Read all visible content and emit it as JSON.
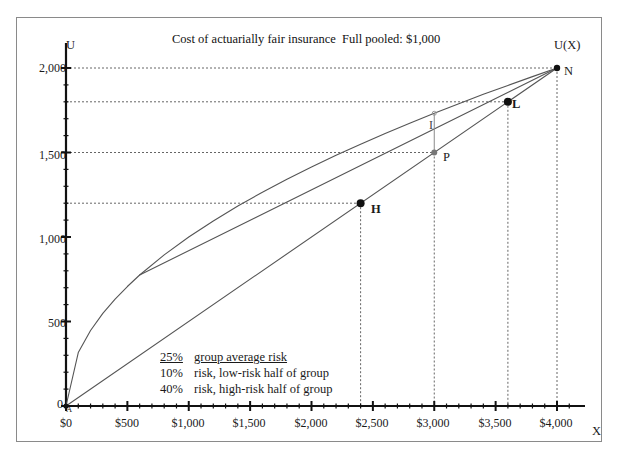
{
  "titles": {
    "main": "Cost of actuarially fair insurance",
    "pooled": "Full pooled: $1,000"
  },
  "axes": {
    "y_label": "U",
    "x_label": "X",
    "curve_label": "U(X)",
    "origin_label": "0",
    "origin_point_label": "A",
    "y_ticks": [
      "2,000",
      "1,500",
      "1,000",
      "500"
    ],
    "x_ticks": [
      "$0",
      "$500",
      "$1,000",
      "$1,500",
      "$2,000",
      "$2,500",
      "$3,000",
      "$3,500",
      "$4,000"
    ]
  },
  "points": {
    "H": "H",
    "L": "L",
    "P": "P",
    "N": "N",
    "I": "I"
  },
  "notes": {
    "line1_pct": "25%",
    "line1_text": "group average risk",
    "line2_pct": "10%",
    "line2_text": "risk, low-risk half of group",
    "line3_pct": "40%",
    "line3_text": "risk, high-risk half of group"
  },
  "colors": {
    "ink": "#1a1a1a",
    "axis": "#111111",
    "curve": "#555555",
    "grid": "#666666",
    "frame": "#8a8a8a"
  },
  "chart_data": {
    "type": "line",
    "title": "Cost of actuarially fair insurance",
    "subtitle": "Full pooled: $1,000",
    "xlabel": "X",
    "ylabel": "U",
    "xlim": [
      0,
      4200
    ],
    "ylim": [
      0,
      2100
    ],
    "grid": "dotted horizontal gridlines at marked utility levels, dotted vertical droplines at marked wealth levels",
    "legend": "none",
    "x_tick_values": [
      0,
      500,
      1000,
      1500,
      2000,
      2500,
      3000,
      3500,
      4000
    ],
    "x_tick_labels": [
      "$0",
      "$500",
      "$1,000",
      "$1,500",
      "$2,000",
      "$2,500",
      "$3,000",
      "$3,500",
      "$4,000"
    ],
    "y_tick_values": [
      0,
      500,
      1000,
      1500,
      2000
    ],
    "y_tick_labels": [
      "0",
      "500",
      "1,000",
      "1,500",
      "2,000"
    ],
    "x_minor_tick_step": 100,
    "y_minor_tick_step": 100,
    "series": [
      {
        "name": "U(X)",
        "type": "curve",
        "description": "concave utility of wealth curve from A(0,0) to N(4000,2000)",
        "x": [
          0,
          100,
          200,
          300,
          400,
          500,
          600,
          800,
          1000,
          1200,
          1400,
          1600,
          1800,
          2000,
          2200,
          2400,
          2600,
          2800,
          3000,
          3200,
          3400,
          3600,
          3800,
          4000
        ],
        "y": [
          0,
          316,
          447,
          548,
          632,
          707,
          775,
          894,
          1000,
          1095,
          1183,
          1265,
          1342,
          1414,
          1483,
          1549,
          1613,
          1673,
          1732,
          1789,
          1844,
          1897,
          1949,
          2000
        ]
      },
      {
        "name": "chord A-N",
        "type": "line",
        "description": "straight expected-utility line from A(0,0) through H, P, L to N(4000,2000)",
        "x": [
          0,
          4000
        ],
        "y": [
          0,
          2000
        ]
      },
      {
        "name": "line N to low-wealth",
        "type": "line",
        "description": "second straight segment converging at N from lower left",
        "x": [
          600,
          4000
        ],
        "y": [
          775,
          2000
        ]
      }
    ],
    "annotations": [
      {
        "label": "A",
        "x": 0,
        "y": 0,
        "note": "origin"
      },
      {
        "label": "H",
        "x": 2400,
        "y": 1200,
        "note": "point on chord, high-risk half"
      },
      {
        "label": "P",
        "x": 3000,
        "y": 1500,
        "note": "pooled point on chord"
      },
      {
        "label": "I",
        "x": 3000,
        "y": 1616,
        "note": "vertical gap between P and U(X) at $3,000"
      },
      {
        "label": "L",
        "x": 3600,
        "y": 1800,
        "note": "point on chord, low-risk half"
      },
      {
        "label": "N",
        "x": 4000,
        "y": 2000,
        "note": "no-loss endpoint"
      },
      {
        "label": "25% group average risk",
        "x": 1000,
        "y": 370
      },
      {
        "label": "10% risk, low-risk half of group",
        "x": 1000,
        "y": 300
      },
      {
        "label": "40% risk, high-risk half of group",
        "x": 1000,
        "y": 230
      }
    ]
  }
}
